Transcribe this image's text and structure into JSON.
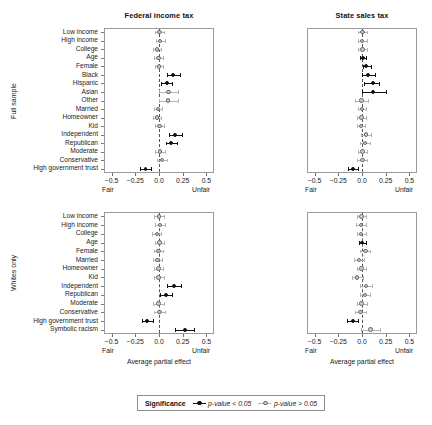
{
  "figure": {
    "legend": {
      "title": "Significance",
      "items": [
        {
          "label": "p-value < 0.05",
          "key": "sig"
        },
        {
          "label": "p-value > 0.05",
          "key": "nonsig"
        }
      ]
    },
    "axis": {
      "title": "Average partial effect",
      "low_end_label": "Fair",
      "high_end_label": "Unfair",
      "ticks": [
        -0.5,
        -0.25,
        0.0,
        0.25,
        0.5
      ],
      "tick_labels": [
        "−0.5",
        "−0.25",
        "0.0",
        "0.25",
        "0.5"
      ],
      "xlim": [
        -0.58,
        0.58
      ]
    },
    "column_titles": [
      "Federal income tax",
      "State sales tax"
    ],
    "row_strip_labels": [
      "Full sample",
      "Whites only"
    ]
  },
  "chart_data": {
    "type": "scatter",
    "title": "",
    "xlabel": "Average partial effect",
    "ylabel": "",
    "xlim": [
      -0.58,
      0.58
    ],
    "grid": false,
    "legend_position": "bottom",
    "reference_line": 0.0,
    "panels": [
      {
        "row": "Full sample",
        "column": "Federal income tax",
        "categories": [
          "Low income",
          "High income",
          "College",
          "Age",
          "Female",
          "Black",
          "Hispanic",
          "Asian",
          "Other",
          "Married",
          "Homeowner",
          "Kid",
          "Independent",
          "Republican",
          "Moderate",
          "Conservative",
          "High government trust"
        ],
        "points": [
          {
            "term": "Low income",
            "estimate": 0.005,
            "ci_low": -0.045,
            "ci_high": 0.055,
            "significant": false
          },
          {
            "term": "High income",
            "estimate": 0.012,
            "ci_low": -0.036,
            "ci_high": 0.06,
            "significant": false
          },
          {
            "term": "College",
            "estimate": -0.018,
            "ci_low": -0.062,
            "ci_high": 0.026,
            "significant": false
          },
          {
            "term": "Age",
            "estimate": -0.005,
            "ci_low": -0.05,
            "ci_high": 0.04,
            "significant": false
          },
          {
            "term": "Female",
            "estimate": 0.002,
            "ci_low": -0.04,
            "ci_high": 0.044,
            "significant": false
          },
          {
            "term": "Black",
            "estimate": 0.152,
            "ci_low": 0.08,
            "ci_high": 0.224,
            "significant": true
          },
          {
            "term": "Hispanic",
            "estimate": 0.08,
            "ci_low": 0.02,
            "ci_high": 0.142,
            "significant": true
          },
          {
            "term": "Asian",
            "estimate": 0.1,
            "ci_low": 0.0,
            "ci_high": 0.205,
            "significant": false
          },
          {
            "term": "Other",
            "estimate": 0.098,
            "ci_low": -0.005,
            "ci_high": 0.205,
            "significant": false
          },
          {
            "term": "Married",
            "estimate": -0.01,
            "ci_low": -0.052,
            "ci_high": 0.032,
            "significant": false
          },
          {
            "term": "Homeowner",
            "estimate": -0.022,
            "ci_low": -0.068,
            "ci_high": 0.024,
            "significant": false
          },
          {
            "term": "Kid",
            "estimate": 0.004,
            "ci_low": -0.042,
            "ci_high": 0.05,
            "significant": false
          },
          {
            "term": "Independent",
            "estimate": 0.172,
            "ci_low": 0.108,
            "ci_high": 0.238,
            "significant": true
          },
          {
            "term": "Republican",
            "estimate": 0.128,
            "ci_low": 0.07,
            "ci_high": 0.188,
            "significant": true
          },
          {
            "term": "Moderate",
            "estimate": 0.01,
            "ci_low": -0.04,
            "ci_high": 0.06,
            "significant": false
          },
          {
            "term": "Conservative",
            "estimate": 0.03,
            "ci_low": -0.024,
            "ci_high": 0.084,
            "significant": false
          },
          {
            "term": "High government trust",
            "estimate": -0.142,
            "ci_low": -0.196,
            "ci_high": -0.088,
            "significant": true
          }
        ]
      },
      {
        "row": "Full sample",
        "column": "State sales tax",
        "categories": [
          "Low income",
          "High income",
          "College",
          "Age",
          "Female",
          "Black",
          "Hispanic",
          "Asian",
          "Other",
          "Married",
          "Homeowner",
          "Kid",
          "Independent",
          "Republican",
          "Moderate",
          "Conservative",
          "High government trust"
        ],
        "points": [
          {
            "term": "Low income",
            "estimate": 0.004,
            "ci_low": -0.042,
            "ci_high": 0.05,
            "significant": false
          },
          {
            "term": "High income",
            "estimate": 0.002,
            "ci_low": -0.044,
            "ci_high": 0.048,
            "significant": false
          },
          {
            "term": "College",
            "estimate": 0.004,
            "ci_low": -0.04,
            "ci_high": 0.048,
            "significant": false
          },
          {
            "term": "Age",
            "estimate": 0.01,
            "ci_low": -0.018,
            "ci_high": 0.038,
            "significant": true
          },
          {
            "term": "Female",
            "estimate": 0.045,
            "ci_low": 0.006,
            "ci_high": 0.096,
            "significant": true
          },
          {
            "term": "Black",
            "estimate": 0.064,
            "ci_low": -0.002,
            "ci_high": 0.132,
            "significant": true
          },
          {
            "term": "Hispanic",
            "estimate": 0.112,
            "ci_low": 0.026,
            "ci_high": 0.182,
            "significant": true
          },
          {
            "term": "Asian",
            "estimate": 0.12,
            "ci_low": 0.004,
            "ci_high": 0.252,
            "significant": true
          },
          {
            "term": "Other",
            "estimate": -0.004,
            "ci_low": -0.072,
            "ci_high": 0.062,
            "significant": false
          },
          {
            "term": "Married",
            "estimate": 0.0,
            "ci_low": -0.04,
            "ci_high": 0.04,
            "significant": false
          },
          {
            "term": "Homeowner",
            "estimate": -0.004,
            "ci_low": -0.05,
            "ci_high": 0.042,
            "significant": false
          },
          {
            "term": "Kid",
            "estimate": -0.01,
            "ci_low": -0.056,
            "ci_high": 0.036,
            "significant": false
          },
          {
            "term": "Independent",
            "estimate": 0.04,
            "ci_low": -0.014,
            "ci_high": 0.094,
            "significant": false
          },
          {
            "term": "Republican",
            "estimate": 0.03,
            "ci_low": -0.018,
            "ci_high": 0.08,
            "significant": false
          },
          {
            "term": "Moderate",
            "estimate": 0.004,
            "ci_low": -0.046,
            "ci_high": 0.054,
            "significant": false
          },
          {
            "term": "Conservative",
            "estimate": 0.004,
            "ci_low": -0.048,
            "ci_high": 0.056,
            "significant": false
          },
          {
            "term": "High government trust",
            "estimate": -0.098,
            "ci_low": -0.148,
            "ci_high": -0.046,
            "significant": true
          }
        ]
      },
      {
        "row": "Whites only",
        "column": "Federal income tax",
        "categories": [
          "Low income",
          "High income",
          "College",
          "Age",
          "Female",
          "Married",
          "Homeowner",
          "Kid",
          "Independent",
          "Republican",
          "Moderate",
          "Conservative",
          "High government trust",
          "Symbolic racism"
        ],
        "points": [
          {
            "term": "Low income",
            "estimate": 0.0,
            "ci_low": -0.054,
            "ci_high": 0.054,
            "significant": false
          },
          {
            "term": "High income",
            "estimate": 0.01,
            "ci_low": -0.042,
            "ci_high": 0.062,
            "significant": false
          },
          {
            "term": "College",
            "estimate": -0.024,
            "ci_low": -0.072,
            "ci_high": 0.024,
            "significant": false
          },
          {
            "term": "Age",
            "estimate": 0.006,
            "ci_low": -0.044,
            "ci_high": 0.056,
            "significant": false
          },
          {
            "term": "Female",
            "estimate": -0.006,
            "ci_low": -0.052,
            "ci_high": 0.04,
            "significant": false
          },
          {
            "term": "Married",
            "estimate": -0.014,
            "ci_low": -0.062,
            "ci_high": 0.034,
            "significant": false
          },
          {
            "term": "Homeowner",
            "estimate": -0.004,
            "ci_low": -0.054,
            "ci_high": 0.046,
            "significant": false
          },
          {
            "term": "Kid",
            "estimate": -0.004,
            "ci_low": -0.056,
            "ci_high": 0.048,
            "significant": false
          },
          {
            "term": "Independent",
            "estimate": 0.16,
            "ci_low": 0.086,
            "ci_high": 0.234,
            "significant": true
          },
          {
            "term": "Republican",
            "estimate": 0.076,
            "ci_low": 0.012,
            "ci_high": 0.14,
            "significant": true
          },
          {
            "term": "Moderate",
            "estimate": -0.004,
            "ci_low": -0.06,
            "ci_high": 0.052,
            "significant": false
          },
          {
            "term": "Conservative",
            "estimate": 0.006,
            "ci_low": -0.052,
            "ci_high": 0.064,
            "significant": false
          },
          {
            "term": "High government trust",
            "estimate": -0.122,
            "ci_low": -0.182,
            "ci_high": -0.062,
            "significant": true
          },
          {
            "term": "Symbolic racism",
            "estimate": 0.272,
            "ci_low": 0.172,
            "ci_high": 0.368,
            "significant": true
          }
        ]
      },
      {
        "row": "Whites only",
        "column": "State sales tax",
        "categories": [
          "Low income",
          "High income",
          "College",
          "Age",
          "Female",
          "Married",
          "Homeowner",
          "Kid",
          "Independent",
          "Republican",
          "Moderate",
          "Conservative",
          "High government trust",
          "Symbolic racism"
        ],
        "points": [
          {
            "term": "Low income",
            "estimate": -0.004,
            "ci_low": -0.054,
            "ci_high": 0.046,
            "significant": false
          },
          {
            "term": "High income",
            "estimate": -0.01,
            "ci_low": -0.06,
            "ci_high": 0.04,
            "significant": false
          },
          {
            "term": "College",
            "estimate": -0.008,
            "ci_low": -0.056,
            "ci_high": 0.04,
            "significant": false
          },
          {
            "term": "Age",
            "estimate": 0.004,
            "ci_low": -0.03,
            "ci_high": 0.038,
            "significant": true
          },
          {
            "term": "Female",
            "estimate": 0.036,
            "ci_low": -0.016,
            "ci_high": 0.088,
            "significant": false
          },
          {
            "term": "Married",
            "estimate": -0.03,
            "ci_low": -0.08,
            "ci_high": 0.02,
            "significant": false
          },
          {
            "term": "Homeowner",
            "estimate": -0.006,
            "ci_low": -0.056,
            "ci_high": 0.044,
            "significant": false
          },
          {
            "term": "Kid",
            "estimate": -0.052,
            "ci_low": -0.11,
            "ci_high": 0.006,
            "significant": false
          },
          {
            "term": "Independent",
            "estimate": 0.044,
            "ci_low": -0.02,
            "ci_high": 0.108,
            "significant": false
          },
          {
            "term": "Republican",
            "estimate": 0.03,
            "ci_low": -0.02,
            "ci_high": 0.082,
            "significant": false
          },
          {
            "term": "Moderate",
            "estimate": -0.004,
            "ci_low": -0.058,
            "ci_high": 0.05,
            "significant": false
          },
          {
            "term": "Conservative",
            "estimate": -0.014,
            "ci_low": -0.072,
            "ci_high": 0.044,
            "significant": false
          },
          {
            "term": "High government trust",
            "estimate": -0.098,
            "ci_low": -0.158,
            "ci_high": -0.04,
            "significant": true
          },
          {
            "term": "Symbolic racism",
            "estimate": 0.09,
            "ci_low": -0.01,
            "ci_high": 0.19,
            "significant": false
          }
        ]
      }
    ]
  }
}
